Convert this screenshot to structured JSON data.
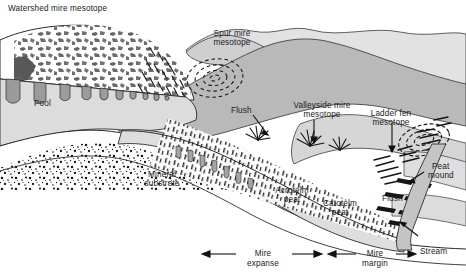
{
  "figure": {
    "type": "cross-section-diagram",
    "background_color": "#ffffff",
    "line_color": "#1a1a1a"
  },
  "labels": {
    "watershed_mire": "Watershed mire mesotope",
    "spur_mire_l1": "Spur mire",
    "spur_mire_l2": "mesotope",
    "pool": "Pool",
    "flush_left": "Flush",
    "valleyside_l1": "Valleyside mire",
    "valleyside_l2": "mesotope",
    "ladder_fen_l1": "Ladder fen",
    "ladder_fen_l2": "mesotope",
    "mineral_l1": "Mineral",
    "mineral_l2": "substrate",
    "acrotelm_l1": "Acrotelm",
    "acrotelm_l2": "peat",
    "catotelm_l1": "Catotelm",
    "catotelm_l2": "peat",
    "peat_mound_l1": "Peat",
    "peat_mound_l2": "mound",
    "flush_right": "Flush",
    "stream": "Stream",
    "mire_expanse_l1": "Mire",
    "mire_expanse_l2": "expanse",
    "mire_margin_l1": "Mire",
    "mire_margin_l2": "margin"
  },
  "colors": {
    "hill_light": "#dcdcdc",
    "hill_mid": "#c6c6c6",
    "hill_dark": "#b0b0b0",
    "peat_body": "#e0e0e0",
    "pool_fill": "#9b9b9b",
    "dome_dark": "#6e6e6e",
    "outline": "#2b2b2b",
    "stipple": "#1a1a1a"
  },
  "scale_bars": [
    {
      "name": "mire-expanse",
      "label_line1": "Mire",
      "label_line2": "expanse",
      "arrow": "double-headed"
    },
    {
      "name": "mire-margin",
      "label_line1": "Mire",
      "label_line2": "margin",
      "arrow": "double-headed"
    }
  ],
  "annotations": [
    {
      "name": "flush-left",
      "text": "Flush",
      "pointer": "arrow"
    },
    {
      "name": "valleyside-mire-mesotope",
      "text": "Valleyside mire mesotope",
      "pointer": "arrow"
    },
    {
      "name": "ladder-fen-mesotope",
      "text": "Ladder fen mesotope",
      "pointer": "arrow"
    },
    {
      "name": "peat-mound",
      "text": "Peat mound",
      "pointer": "arrow"
    },
    {
      "name": "stream",
      "text": "Stream",
      "pointer": "arrow"
    }
  ]
}
